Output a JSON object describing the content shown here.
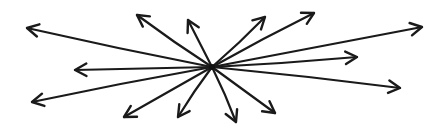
{
  "figure": {
    "stroke_color": "#1a1a1a",
    "background": "#ffffff",
    "center": [
      212,
      67
    ],
    "arrow_count": 14,
    "arrows": [
      {
        "name": "left-upper",
        "tip": [
          27,
          28
        ]
      },
      {
        "name": "left-middle",
        "tip": [
          75,
          70
        ]
      },
      {
        "name": "left-lower",
        "tip": [
          32,
          102
        ]
      },
      {
        "name": "up-left",
        "tip": [
          137,
          15
        ]
      },
      {
        "name": "up",
        "tip": [
          188,
          20
        ]
      },
      {
        "name": "up-right-1",
        "tip": [
          265,
          17
        ]
      },
      {
        "name": "up-right-2",
        "tip": [
          314,
          13
        ]
      },
      {
        "name": "right-upper",
        "tip": [
          422,
          27
        ]
      },
      {
        "name": "right-middle",
        "tip": [
          357,
          57
        ]
      },
      {
        "name": "right-lower",
        "tip": [
          400,
          88
        ]
      },
      {
        "name": "down-left-1",
        "tip": [
          124,
          117
        ]
      },
      {
        "name": "down-left-2",
        "tip": [
          178,
          117
        ]
      },
      {
        "name": "down",
        "tip": [
          236,
          122
        ]
      },
      {
        "name": "down-right",
        "tip": [
          275,
          113
        ]
      }
    ]
  }
}
